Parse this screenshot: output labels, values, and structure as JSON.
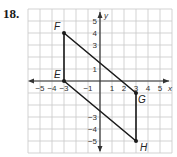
{
  "problem": {
    "number": "18."
  },
  "graph": {
    "x_axis_label": "x",
    "y_axis_label": "y",
    "x_range": [
      -6,
      6
    ],
    "y_range": [
      -6,
      6
    ],
    "x_tick_labels": [
      {
        "value": -5,
        "label": "−5"
      },
      {
        "value": -4,
        "label": "−4"
      },
      {
        "value": -3,
        "label": "−3"
      },
      {
        "value": -1,
        "label": "−1"
      },
      {
        "value": 1,
        "label": "1"
      },
      {
        "value": 2,
        "label": "2"
      },
      {
        "value": 3,
        "label": "3"
      },
      {
        "value": 4,
        "label": "4"
      },
      {
        "value": 5,
        "label": "5"
      }
    ],
    "y_tick_labels": [
      {
        "value": 5,
        "label": "5"
      },
      {
        "value": 4,
        "label": "4"
      },
      {
        "value": 3,
        "label": "3"
      },
      {
        "value": 1,
        "label": "1"
      },
      {
        "value": -3,
        "label": "−3"
      },
      {
        "value": -4,
        "label": "−4"
      },
      {
        "value": -5,
        "label": "−5"
      }
    ],
    "points": [
      {
        "name": "E",
        "x": -3,
        "y": 0
      },
      {
        "name": "F",
        "x": -3,
        "y": 4
      },
      {
        "name": "G",
        "x": 3,
        "y": -1
      },
      {
        "name": "H",
        "x": 3,
        "y": -5
      }
    ],
    "polygon": [
      "E",
      "F",
      "G",
      "H"
    ],
    "colors": {
      "grid": "#c8c8c8",
      "axis": "#333333",
      "shape": "#1a1a1a"
    }
  }
}
